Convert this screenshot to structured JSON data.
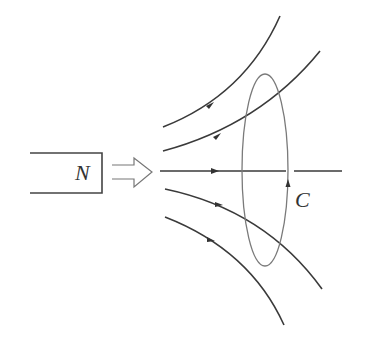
{
  "diagram": {
    "magnet": {
      "pole_label": "N"
    },
    "motion_arrow": {
      "icon": "hollow-right-arrow",
      "direction": "right"
    },
    "loop": {
      "label": "C",
      "circulation_arrow": "up-on-right-side"
    },
    "field_lines": {
      "count": 5,
      "direction": "right"
    },
    "colors": {
      "line": "#3a3a3a",
      "loop": "#7a7a7a",
      "background": "#ffffff"
    }
  }
}
